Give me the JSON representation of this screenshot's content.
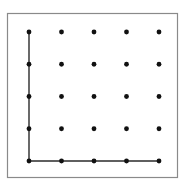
{
  "figure": {
    "background_color": "#ffffff",
    "frame": {
      "name": "outer-border",
      "x": 7.5,
      "y": 13.5,
      "width": 170,
      "height": 164,
      "stroke_color": "#8a8a8a",
      "stroke_width": 1.2,
      "fill": "none"
    },
    "dot_style": {
      "color": "#111111",
      "radius": 2.4,
      "shape": "filled-circle"
    },
    "path_style": {
      "color": "#2b2b2b",
      "stroke_width": 1.4,
      "linecap": "square",
      "linejoin": "miter"
    }
  },
  "chart_data": {
    "type": "scatter",
    "xlabel": "",
    "ylabel": "",
    "grid": false,
    "legend": "none",
    "xlim": [
      0,
      4
    ],
    "ylim": [
      0,
      4
    ],
    "x_tick_labels": [
      "0",
      "1",
      "2",
      "3",
      "4"
    ],
    "y_tick_labels": [
      "0",
      "1",
      "2",
      "3",
      "4"
    ],
    "columns_px": [
      29,
      61.5,
      94,
      126.5,
      159
    ],
    "rows_px": [
      32,
      64.25,
      96.5,
      128.75,
      161
    ],
    "rows": 5,
    "columns": 5,
    "point_count": 25,
    "points": [
      {
        "col": 0,
        "row": 0,
        "cx": 29,
        "cy": 32
      },
      {
        "col": 1,
        "row": 0,
        "cx": 61.5,
        "cy": 32
      },
      {
        "col": 2,
        "row": 0,
        "cx": 94,
        "cy": 32
      },
      {
        "col": 3,
        "row": 0,
        "cx": 126.5,
        "cy": 32
      },
      {
        "col": 4,
        "row": 0,
        "cx": 159,
        "cy": 32
      },
      {
        "col": 0,
        "row": 1,
        "cx": 29,
        "cy": 64.25
      },
      {
        "col": 1,
        "row": 1,
        "cx": 61.5,
        "cy": 64.25
      },
      {
        "col": 2,
        "row": 1,
        "cx": 94,
        "cy": 64.25
      },
      {
        "col": 3,
        "row": 1,
        "cx": 126.5,
        "cy": 64.25
      },
      {
        "col": 4,
        "row": 1,
        "cx": 159,
        "cy": 64.25
      },
      {
        "col": 0,
        "row": 2,
        "cx": 29,
        "cy": 96.5
      },
      {
        "col": 1,
        "row": 2,
        "cx": 61.5,
        "cy": 96.5
      },
      {
        "col": 2,
        "row": 2,
        "cx": 94,
        "cy": 96.5
      },
      {
        "col": 3,
        "row": 2,
        "cx": 126.5,
        "cy": 96.5
      },
      {
        "col": 4,
        "row": 2,
        "cx": 159,
        "cy": 96.5
      },
      {
        "col": 0,
        "row": 3,
        "cx": 29,
        "cy": 128.75
      },
      {
        "col": 1,
        "row": 3,
        "cx": 61.5,
        "cy": 128.75
      },
      {
        "col": 2,
        "row": 3,
        "cx": 94,
        "cy": 128.75
      },
      {
        "col": 3,
        "row": 3,
        "cx": 126.5,
        "cy": 128.75
      },
      {
        "col": 4,
        "row": 3,
        "cx": 159,
        "cy": 128.75
      },
      {
        "col": 0,
        "row": 4,
        "cx": 29,
        "cy": 161
      },
      {
        "col": 1,
        "row": 4,
        "cx": 61.5,
        "cy": 161
      },
      {
        "col": 2,
        "row": 4,
        "cx": 94,
        "cy": 161
      },
      {
        "col": 3,
        "row": 4,
        "cx": 126.5,
        "cy": 161
      },
      {
        "col": 4,
        "row": 4,
        "cx": 159,
        "cy": 161
      }
    ],
    "annotations": [
      {
        "name": "l-shaped-path",
        "type": "polyline",
        "lattice_points": [
          [
            0,
            4
          ],
          [
            0,
            0
          ],
          [
            4,
            0
          ]
        ],
        "points_px": "29,32 29,161 159,161"
      }
    ]
  }
}
